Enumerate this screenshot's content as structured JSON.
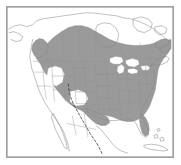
{
  "figure": {
    "type": "species-range-map",
    "region": "North America",
    "projection_hint": "conic",
    "title": "",
    "caption": ""
  },
  "style": {
    "background_color": "#ffffff",
    "frame_color": "#9e9e9e",
    "range_fill_color": "#9a9a9a",
    "range_edge_color": "#7d7d7d",
    "coastline_color": "#8a8a8a",
    "internal_border_color": "#8f8f8f",
    "lake_fill_color": "#ffffff",
    "dashed_line_color": "#3a3a3a"
  },
  "legend": {
    "visible": false,
    "entries": [
      {
        "label": "Range",
        "swatch": "#9a9a9a"
      },
      {
        "label": "Boundary",
        "swatch": "#3a3a3a"
      }
    ]
  },
  "features": {
    "shaded_range_label": "shaded-distribution-area",
    "dashed_boundary_label": "dashed-range-boundary",
    "lakes_label": "great-lakes",
    "coast_label": "coastline",
    "borders_label": "state-province-borders"
  },
  "geometry": {
    "coast_outline": "M 2 30 L 10 26 L 18 24 L 26 22 L 30 18 L 36 14 L 42 12 L 48 11 L 54 9 L 60 7 L 66 5 L 74 4 L 82 3 L 92 3 L 100 4 L 110 5 L 120 6 L 130 8 L 140 10 L 150 13 L 158 17 L 164 22 L 166 28",
    "range_polygon": "M 38 44 L 46 36 L 54 28 L 62 23 L 70 21 L 78 22 L 86 25 L 94 29 L 102 33 L 110 36 L 118 38 L 126 39 L 134 39 L 142 38 L 150 37 L 158 36 L 164 36 L 164 44 L 162 52 L 158 58 L 154 64 L 152 72 L 150 80 L 148 88 L 146 96 L 144 104 L 142 110 L 138 116 L 134 120 L 128 122 L 122 122 L 116 120 L 110 118 L 104 116 L 98 114 L 92 112 L 86 110 L 80 107 L 74 104 L 68 100 L 62 96 L 58 90 L 54 84 L 50 78 L 46 72 L 42 64 L 40 56 Z"
  }
}
